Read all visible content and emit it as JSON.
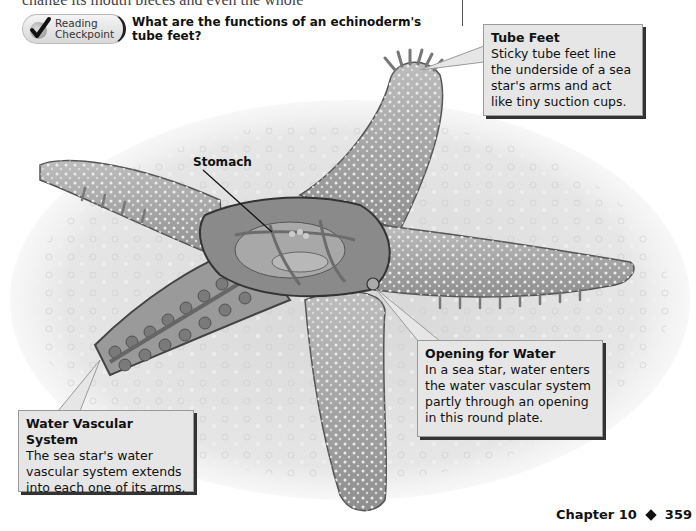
{
  "page": {
    "cutoff_text": "change its mouth pieces and even the whole",
    "footer": {
      "chapter_label": "Chapter 10",
      "separator_icon": "diamond-icon",
      "page_number": "359"
    }
  },
  "reading_checkpoint": {
    "badge_line1": "Reading",
    "badge_line2": "Checkpoint",
    "badge_icon": "checkmark-icon",
    "question": "What are the functions of an echinoderm's tube feet?"
  },
  "figure": {
    "labels": {
      "stomach": "Stomach"
    },
    "callouts": [
      {
        "title": "Tube Feet",
        "body": "Sticky tube feet line the underside of a sea star's arms and act like tiny suction cups."
      },
      {
        "title": "Opening for Water",
        "body": "In a sea star, water enters the water vascular system partly through an opening in this round plate."
      },
      {
        "title": "Water Vascular System",
        "body": "The sea star's water vascular system extends into each one of its arms."
      }
    ]
  }
}
